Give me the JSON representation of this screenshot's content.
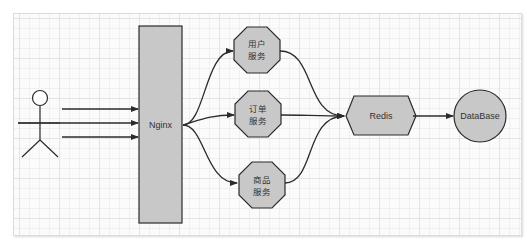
{
  "diagram": {
    "actor": {
      "label": ""
    },
    "nginx": {
      "label": "Nginx"
    },
    "services": [
      {
        "line1": "用户",
        "line2": "服务"
      },
      {
        "line1": "订单",
        "line2": "服务"
      },
      {
        "line1": "商品",
        "line2": "服务"
      }
    ],
    "redis": {
      "label": "Redis"
    },
    "database": {
      "label": "DataBase"
    },
    "colors": {
      "shape_fill": "#c8c8c8",
      "stroke": "#2b2b2b",
      "grid": "#e3e3e3",
      "canvas": "#fbfbfb"
    }
  }
}
